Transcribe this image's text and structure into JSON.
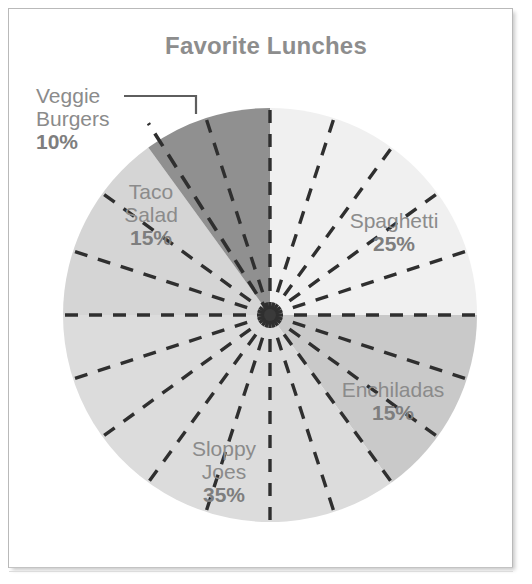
{
  "chart_data": {
    "type": "pie",
    "title": "Favorite Lunches",
    "categories": [
      "Spaghetti",
      "Enchiladas",
      "Sloppy Joes",
      "Taco Salad",
      "Veggie Burgers"
    ],
    "values": [
      25,
      15,
      35,
      15,
      10
    ],
    "value_labels": [
      "25%",
      "15%",
      "35%",
      "15%",
      "10%"
    ],
    "unit": "%",
    "total": 100,
    "start_angle_deg": 0,
    "direction": "clockwise",
    "grid": true,
    "gridline_step_percent": 5,
    "gridline_step_deg": 18,
    "gridline_style": "dashed",
    "legend": "none",
    "labels_placement": "inside-slice",
    "leader_lines": [
      {
        "category": "Veggie Burgers",
        "from_label": true
      }
    ],
    "slice_colors": [
      "#f0f0f0",
      "#c9c9c9",
      "#dedede",
      "#d5d5d5",
      "#909090"
    ],
    "slice_colors_lower_band": [
      "#dcdcdc",
      "#c9c9c9",
      "#dcdcdc",
      "#cfcfcf",
      "#8a8a8a"
    ],
    "xlabel": "",
    "ylabel": ""
  },
  "chart": {
    "title": "Favorite Lunches",
    "slices": [
      {
        "name": "Spaghetti",
        "percent_label": "25%",
        "value": 25,
        "color": "#f0f0f0"
      },
      {
        "name": "Enchiladas",
        "percent_label": "15%",
        "value": 15,
        "color": "#c9c9c9"
      },
      {
        "name": "Sloppy Joes",
        "percent_label": "35%",
        "value": 35,
        "color": "#dedede"
      },
      {
        "name": "Taco Salad",
        "percent_label": "15%",
        "value": 15,
        "color": "#d5d5d5"
      },
      {
        "name": "Veggie Burgers",
        "percent_label": "10%",
        "value": 10,
        "color": "#909090"
      }
    ],
    "labels": {
      "veggie_line1": "Veggie",
      "veggie_line2": "Burgers",
      "veggie_pct": "10%",
      "taco_line1": "Taco",
      "taco_line2": "Salad",
      "taco_pct": "15%",
      "spaghetti_line1": "Spaghetti",
      "spaghetti_pct": "25%",
      "enchiladas_line1": "Enchiladas",
      "enchiladas_pct": "15%",
      "sloppy_line1": "Sloppy",
      "sloppy_line2": "Joes",
      "sloppy_pct": "35%"
    },
    "colors": {
      "title_text": "#8d8d8d",
      "label_text": "#8b8b8b",
      "percent_text": "#7e7e7e",
      "gridline": "#333333",
      "leader_line": "#5a5a5a",
      "frame_border": "#b9b9b9",
      "background": "#ffffff"
    }
  }
}
